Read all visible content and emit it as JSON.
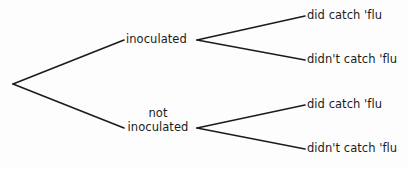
{
  "diagram": {
    "type": "probability-tree",
    "title": "",
    "background_color": "#fdfdfd",
    "line_color": "#1b1b1b",
    "text_color": "#1b1b1b",
    "root": {
      "label": "",
      "x": 13,
      "y": 84
    },
    "branches": [
      {
        "label": "inoculated",
        "x": 128,
        "y": 40,
        "children": [
          {
            "label": "did catch 'flu",
            "x": 307,
            "y": 16
          },
          {
            "label": "didn't catch 'flu",
            "x": 307,
            "y": 60
          }
        ]
      },
      {
        "label_line_1": "not",
        "label_line_2": "inoculated",
        "label": "not inoculated",
        "x": 128,
        "y": 128,
        "children": [
          {
            "label": "did catch 'flu",
            "x": 307,
            "y": 105
          },
          {
            "label": "didn't catch 'flu",
            "x": 307,
            "y": 149
          }
        ]
      }
    ],
    "edges": [
      {
        "name": "root-to-inoculated",
        "x1": 13,
        "y1": 84,
        "x2": 124,
        "y2": 40
      },
      {
        "name": "root-to-not-inoculated",
        "x1": 13,
        "y1": 84,
        "x2": 124,
        "y2": 128
      },
      {
        "name": "inoculated-to-did",
        "x1": 197,
        "y1": 40,
        "x2": 305,
        "y2": 16
      },
      {
        "name": "inoculated-to-didnt",
        "x1": 197,
        "y1": 40,
        "x2": 305,
        "y2": 60
      },
      {
        "name": "not-inoculated-to-did",
        "x1": 197,
        "y1": 128,
        "x2": 305,
        "y2": 105
      },
      {
        "name": "not-inoculated-to-didnt",
        "x1": 197,
        "y1": 128,
        "x2": 305,
        "y2": 149
      }
    ]
  }
}
